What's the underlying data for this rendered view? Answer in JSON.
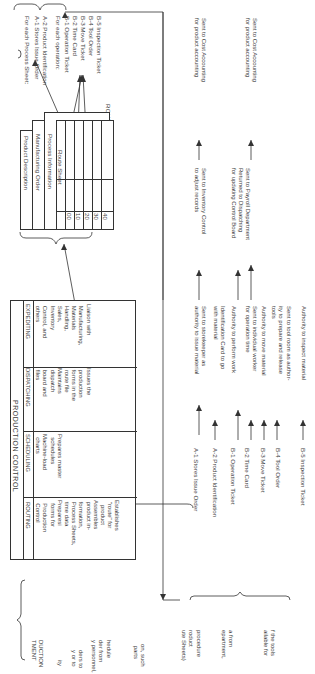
{
  "route_file": {
    "title": "ROUTE FILE",
    "sheets": [
      "Product Description",
      "Manufacturing Order",
      "Process Information",
      "Route Sheet"
    ],
    "operation_numbers": [
      "00",
      "10",
      "20",
      "30",
      "40"
    ]
  },
  "process_sheet_forms": {
    "header": "For each Process Sheet:",
    "items": [
      "A-1  Stores Issue Order",
      "A-2  Product Identification"
    ],
    "operation_header": "For each operation:",
    "operation_items": [
      "B-1  Operation Ticket",
      "B-2  Time Card",
      "B-3  Move Ticket",
      "B-4  Tool Order",
      "B-5  Inspection Ticket"
    ]
  },
  "production_control": {
    "title": "PRODUCTION CONTROL",
    "columns": [
      {
        "header": "ROUTING",
        "text": "Establishes\n \"route\" for\n   product\nAssembles\n product in-\n formation,\n Process Sheets,\n time data\nPreparesi\n  forms for\n  Production\n  Control"
      },
      {
        "header": "SCHEDULING",
        "text": "Prepares master\n  schedules\nMachine-load\n  charts"
      },
      {
        "header": "DISPATCHING",
        "text": "Issues the\n production\n forms in the\n route file\nMaintains\n dispatch\n board and\n files"
      },
      {
        "header": "EXPEDITING",
        "text": "Liaison with\n Manufacturing,\n Materials\n Handling,\n Sales,\n Inventory\n Control, and\n others"
      }
    ]
  },
  "form_flow": [
    {
      "form": "A-1  Stores Issue Order",
      "use": "Sent to storekeeper as\nauthority to issue material",
      "destination": "Sent to Inventory Control\nto adjust records",
      "final": "Sent to Cost Accounting\nfor product accounting"
    },
    {
      "form": "A-2  Product Identification",
      "use": "Identification Card to go\nwith material",
      "destination": "",
      "final": ""
    },
    {
      "form": "B-1  Operation Ticket",
      "use": "Authority to perform work",
      "destination": "Returned to Dispatching\nfor updating Control Board",
      "final": ""
    },
    {
      "form": "B-2  Time Card",
      "use": "Sent to individual worker\nfor operation time",
      "destination": "Sent to Payroll Department",
      "final": "Sent to Cost Accounting\nfor product accounting"
    },
    {
      "form": "B-3  Move Ticket",
      "use": "Authority to move material",
      "destination": "",
      "final": ""
    },
    {
      "form": "B-4  Tool Order",
      "use": "Sent to tool room as author-\nity to prepare and release\ntools",
      "destination": "",
      "final": ""
    },
    {
      "form": "B-5  Inspection Ticket",
      "use": "Authority to inspect material",
      "destination": "",
      "final": ""
    }
  ],
  "left_partial_text": {
    "heading": "DUCTION\nTMENT",
    "fragments": [
      "ity",
      "ders to\ny or to",
      "hedule\nder from\ny personnel,",
      "on, such\n parts",
      "procedure\nroduct\nute Sheets)",
      "a from\nepartment,",
      "f the tools\nailable for"
    ]
  }
}
